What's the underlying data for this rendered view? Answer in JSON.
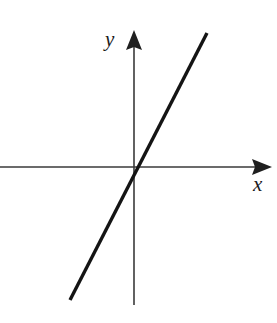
{
  "figure": {
    "background_color": "#ffffff",
    "width": 277,
    "height": 323
  },
  "axes": {
    "x_axis": {
      "label": "x",
      "icon": "arrow-right-icon",
      "color": "#3a3a3a",
      "y_position": 167,
      "start_x": 0,
      "end_x": 272
    },
    "y_axis": {
      "label": "y",
      "icon": "arrow-up-icon",
      "color": "#3a3a3a",
      "x_position": 134,
      "start_y": 305,
      "end_y": 30
    },
    "origin": {
      "x": 134,
      "y": 167
    }
  },
  "chart_data": {
    "type": "line",
    "title": "",
    "subtitle": "",
    "xlabel": "x",
    "ylabel": "y",
    "grid": false,
    "legend": false,
    "axis_style": "arrows-both-ends",
    "tick_labels": {
      "x": [],
      "y": []
    },
    "xlim": [
      -4.6,
      4.8
    ],
    "ylim": [
      -4.7,
      4.8
    ],
    "series": [
      {
        "name": "y = 2x",
        "color": "#141414",
        "line_width": 3.4,
        "slope": 2,
        "intercept": 0,
        "x": [
          -2.2,
          2.3
        ],
        "y": [
          -4.4,
          4.6
        ],
        "pixel_endpoints": [
          [
            70,
            300
          ],
          [
            207,
            33
          ]
        ],
        "passes_through_origin": true,
        "annotations": []
      }
    ]
  }
}
